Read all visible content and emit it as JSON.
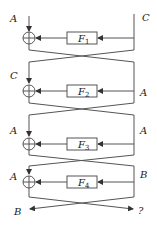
{
  "diagram": {
    "rounds": [
      {
        "f_label": "F",
        "f_sub": "1",
        "left_in": "A",
        "right_in": "C"
      },
      {
        "f_label": "F",
        "f_sub": "2",
        "left_in": "C",
        "right_in": "A"
      },
      {
        "f_label": "F",
        "f_sub": "3",
        "left_in": "A",
        "right_in": "A"
      },
      {
        "f_label": "F",
        "f_sub": "4",
        "left_in": "A",
        "right_in": "B"
      }
    ],
    "outputs": {
      "left": "B",
      "right": "?"
    },
    "colors": {
      "line": "#555555",
      "text": "#222222",
      "background": "#ffffff"
    }
  }
}
